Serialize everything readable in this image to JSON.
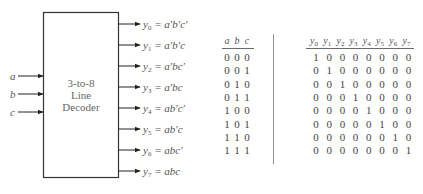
{
  "decoder": {
    "title_lines": [
      "3-to-8",
      "Line",
      "Decoder"
    ],
    "inputs": [
      "a",
      "b",
      "c"
    ],
    "outputs": [
      {
        "name": "y",
        "sub": "0",
        "expr": "a′b′c′"
      },
      {
        "name": "y",
        "sub": "1",
        "expr": "a′b′c"
      },
      {
        "name": "y",
        "sub": "2",
        "expr": "a′bc′"
      },
      {
        "name": "y",
        "sub": "3",
        "expr": "a′bc"
      },
      {
        "name": "y",
        "sub": "4",
        "expr": "ab′c′"
      },
      {
        "name": "y",
        "sub": "5",
        "expr": "ab′c"
      },
      {
        "name": "y",
        "sub": "6",
        "expr": "abc′"
      },
      {
        "name": "y",
        "sub": "7",
        "expr": "abc"
      }
    ]
  },
  "truth_table": {
    "input_headers": [
      "a",
      "b",
      "c"
    ],
    "output_headers": [
      {
        "name": "y",
        "sub": "0"
      },
      {
        "name": "y",
        "sub": "1"
      },
      {
        "name": "y",
        "sub": "2"
      },
      {
        "name": "y",
        "sub": "3"
      },
      {
        "name": "y",
        "sub": "4"
      },
      {
        "name": "y",
        "sub": "5"
      },
      {
        "name": "y",
        "sub": "6"
      },
      {
        "name": "y",
        "sub": "7"
      }
    ],
    "rows": [
      {
        "in": [
          "0",
          "0",
          "0"
        ],
        "out": [
          "1",
          "0",
          "0",
          "0",
          "0",
          "0",
          "0",
          "0"
        ]
      },
      {
        "in": [
          "0",
          "0",
          "1"
        ],
        "out": [
          "0",
          "1",
          "0",
          "0",
          "0",
          "0",
          "0",
          "0"
        ]
      },
      {
        "in": [
          "0",
          "1",
          "0"
        ],
        "out": [
          "0",
          "0",
          "1",
          "0",
          "0",
          "0",
          "0",
          "0"
        ]
      },
      {
        "in": [
          "0",
          "1",
          "1"
        ],
        "out": [
          "0",
          "0",
          "0",
          "1",
          "0",
          "0",
          "0",
          "0"
        ]
      },
      {
        "in": [
          "1",
          "0",
          "0"
        ],
        "out": [
          "0",
          "0",
          "0",
          "0",
          "1",
          "0",
          "0",
          "0"
        ]
      },
      {
        "in": [
          "1",
          "0",
          "1"
        ],
        "out": [
          "0",
          "0",
          "0",
          "0",
          "0",
          "1",
          "0",
          "0"
        ]
      },
      {
        "in": [
          "1",
          "1",
          "0"
        ],
        "out": [
          "0",
          "0",
          "0",
          "0",
          "0",
          "0",
          "1",
          "0"
        ]
      },
      {
        "in": [
          "1",
          "1",
          "1"
        ],
        "out": [
          "0",
          "0",
          "0",
          "0",
          "0",
          "0",
          "0",
          "1"
        ]
      }
    ]
  }
}
